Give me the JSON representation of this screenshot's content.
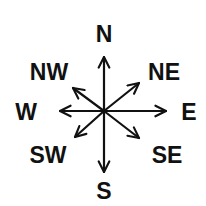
{
  "diagram": {
    "type": "compass-rose",
    "center": [
      104,
      111
    ],
    "colors": {
      "ink": "#111111",
      "background": "#ffffff"
    },
    "directions": [
      {
        "id": "n",
        "label": "N",
        "tip": [
          104,
          57
        ],
        "label_pos": [
          104,
          42
        ]
      },
      {
        "id": "ne",
        "label": "NE",
        "tip": [
          139,
          83
        ],
        "label_pos": [
          164,
          80
        ]
      },
      {
        "id": "e",
        "label": "E",
        "tip": [
          166,
          111
        ],
        "label_pos": [
          189,
          120
        ]
      },
      {
        "id": "se",
        "label": "SE",
        "tip": [
          139,
          138
        ],
        "label_pos": [
          167,
          163
        ]
      },
      {
        "id": "s",
        "label": "S",
        "tip": [
          104,
          172
        ],
        "label_pos": [
          104,
          199
        ]
      },
      {
        "id": "sw",
        "label": "SW",
        "tip": [
          75,
          137
        ],
        "label_pos": [
          48,
          163
        ]
      },
      {
        "id": "w",
        "label": "W",
        "tip": [
          60,
          111
        ],
        "label_pos": [
          26,
          120
        ]
      },
      {
        "id": "nw",
        "label": "NW",
        "tip": [
          73,
          88
        ],
        "label_pos": [
          49,
          80
        ]
      }
    ]
  }
}
